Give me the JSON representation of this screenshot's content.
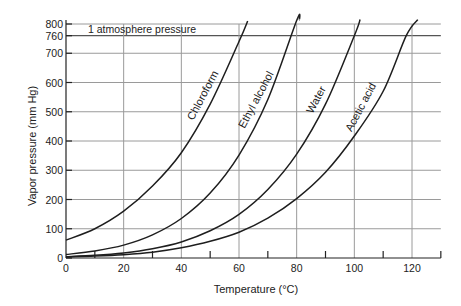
{
  "chart_data": {
    "type": "line",
    "title": "",
    "xlabel": "Temperature (°C)",
    "ylabel": "Vapor pressure (mm Hg)",
    "xlim": [
      0,
      130
    ],
    "ylim": [
      0,
      800
    ],
    "x_ticks": [
      0,
      20,
      40,
      60,
      80,
      100,
      120
    ],
    "x_minor_ticks": [
      10,
      30,
      50,
      70,
      90,
      110,
      130
    ],
    "y_ticks": [
      0,
      100,
      200,
      300,
      400,
      500,
      600,
      700,
      760,
      800
    ],
    "grid": true,
    "legend": "inline labels along curves",
    "annotations": [
      {
        "text": "1 atmosphere pressure",
        "y": 760
      }
    ],
    "series": [
      {
        "name": "Chloroform",
        "x": [
          0,
          10,
          20,
          30,
          40,
          50,
          60,
          63
        ],
        "values": [
          61,
          100,
          160,
          246,
          360,
          526,
          740,
          810
        ]
      },
      {
        "name": "Ethyl alcohol",
        "x": [
          0,
          10,
          20,
          30,
          40,
          50,
          60,
          70,
          80,
          81
        ],
        "values": [
          12,
          24,
          44,
          79,
          135,
          222,
          352,
          542,
          812,
          840
        ]
      },
      {
        "name": "Water",
        "x": [
          0,
          10,
          20,
          30,
          40,
          50,
          60,
          70,
          80,
          90,
          100,
          102
        ],
        "values": [
          4.6,
          9.2,
          17.5,
          31.8,
          55,
          93,
          149,
          234,
          355,
          526,
          760,
          816
        ]
      },
      {
        "name": "Acetic acid",
        "x": [
          0,
          10,
          20,
          30,
          40,
          50,
          60,
          70,
          80,
          90,
          100,
          110,
          118,
          122
        ],
        "values": [
          3.5,
          6.5,
          11.5,
          20,
          35,
          57,
          88,
          136,
          203,
          293,
          417,
          570,
          760,
          830
        ]
      }
    ]
  },
  "labels": {
    "xlabel": "Temperature (°C)",
    "ylabel": "Vapor pressure (mm Hg)",
    "atm": "1  atmosphere  pressure"
  }
}
